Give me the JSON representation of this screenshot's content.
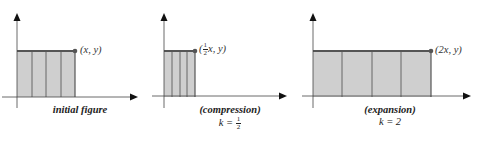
{
  "colors": {
    "fill": "#cfcfcf",
    "stroke": "#555555",
    "axis": "#444444",
    "arrow": "#111111",
    "dot": "#555555"
  },
  "panels": [
    {
      "id": "initial",
      "point_label": "(x, y)",
      "caption_title": "initial figure",
      "caption_k": "",
      "rect_width_factor": 1
    },
    {
      "id": "compression",
      "point_label_prefix": "(",
      "point_label_frac_num": "1",
      "point_label_frac_den": "2",
      "point_label_suffix": "x, y)",
      "caption_title": "(compression)",
      "caption_k_prefix": "k = ",
      "caption_k_frac_num": "1",
      "caption_k_frac_den": "2",
      "rect_width_factor": 0.5
    },
    {
      "id": "expansion",
      "point_label": "(2x, y)",
      "caption_title": "(expansion)",
      "caption_k": "k = 2",
      "rect_width_factor": 2
    }
  ]
}
